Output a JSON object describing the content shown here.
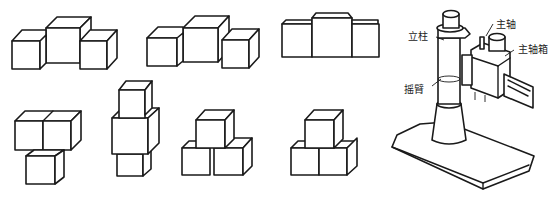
{
  "figure": {
    "type": "isometric-cube-views-and-machine-diagram",
    "stroke_color": "#1a1a1a",
    "background": "#ffffff"
  },
  "cube_groups": [
    {
      "id": "g1",
      "description": "three cubes in a row, larger center cube raised"
    },
    {
      "id": "g2",
      "description": "three cubes, center larger, right cube offset forward"
    },
    {
      "id": "g3",
      "description": "front view, three blocks with raised center"
    },
    {
      "id": "g4",
      "description": "two cubes on top, one cube below left"
    },
    {
      "id": "g5",
      "description": "vertical stack of three cubes, middle larger"
    },
    {
      "id": "g6",
      "description": "pyramid: one cube atop two separated cubes"
    },
    {
      "id": "g7",
      "description": "pyramid: one cube atop two adjoined cubes"
    }
  ],
  "machine": {
    "labels": {
      "column": "立柱",
      "arm": "摇臂",
      "spindle": "主轴",
      "spindle_box": "主轴箱"
    }
  }
}
